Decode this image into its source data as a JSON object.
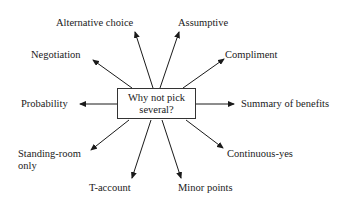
{
  "center": {
    "line1": "Why not pick",
    "line2": "several?"
  },
  "nodes": [
    {
      "id": "alternative-choice",
      "label": "Alternative choice"
    },
    {
      "id": "assumptive",
      "label": "Assumptive"
    },
    {
      "id": "negotiation",
      "label": "Negotiation"
    },
    {
      "id": "compliment",
      "label": "Compliment"
    },
    {
      "id": "probability",
      "label": "Probability"
    },
    {
      "id": "summary-of-benefits",
      "label": "Summary of benefits"
    },
    {
      "id": "standing-room-only",
      "line1": "Standing-room",
      "line2": "only"
    },
    {
      "id": "continuous-yes",
      "label": "Continuous-yes"
    },
    {
      "id": "t-account",
      "label": "T-account"
    },
    {
      "id": "minor-points",
      "label": "Minor points"
    }
  ]
}
